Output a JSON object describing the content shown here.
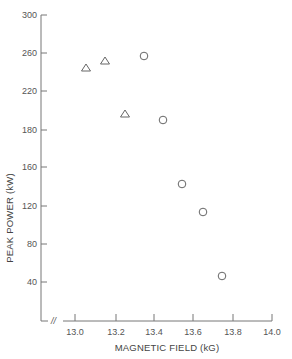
{
  "chart_data": {
    "type": "scatter",
    "title": "",
    "xlabel": "MAGNETIC FIELD (kG)",
    "ylabel": "PEAK POWER (kW)",
    "xlim": [
      12.88,
      14.0
    ],
    "ylim": [
      0,
      300
    ],
    "grid": false,
    "legend": null,
    "x_axis_break_symbol": "//",
    "x_ticks": [
      "13.0",
      "13.2",
      "13.4",
      "13.6",
      "13.8",
      "14.0"
    ],
    "y_ticks": [
      "300",
      "260",
      "220",
      "180",
      "160",
      "120",
      "80",
      "40"
    ],
    "series": [
      {
        "name": "triangles",
        "marker": "triangle-open",
        "points": [
          {
            "x": 13.05,
            "y": 244
          },
          {
            "x": 13.15,
            "y": 252
          },
          {
            "x": 13.25,
            "y": 197
          }
        ]
      },
      {
        "name": "circles",
        "marker": "circle-open",
        "points": [
          {
            "x": 13.35,
            "y": 258
          },
          {
            "x": 13.45,
            "y": 190
          },
          {
            "x": 13.54,
            "y": 142
          },
          {
            "x": 13.65,
            "y": 114
          },
          {
            "x": 13.74,
            "y": 46
          }
        ]
      }
    ]
  },
  "layout": {
    "x_tick_px": [
      75,
      116,
      154,
      193,
      233,
      272
    ],
    "y_tick_px": [
      15,
      53,
      91,
      130,
      167,
      206,
      244,
      282
    ],
    "triangle_px": [
      [
        86,
        68
      ],
      [
        105,
        61
      ],
      [
        125,
        114
      ]
    ],
    "circle_px": [
      [
        144,
        56
      ],
      [
        163,
        120
      ],
      [
        182,
        184
      ],
      [
        203,
        212
      ],
      [
        222,
        276
      ]
    ],
    "colors": {
      "axis": "#777777",
      "marker": "#666666",
      "text": "#555555"
    }
  }
}
